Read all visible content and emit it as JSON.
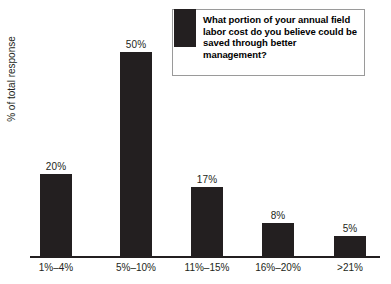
{
  "legend": {
    "question": "What portion of your annual field labor cost do you believe could be saved through better management?",
    "swatch_color": "#231f20",
    "swatch_name": "legend-color-swatch"
  },
  "axes": {
    "ylabel": "% of total response",
    "xlabel": ""
  },
  "chart_data": {
    "type": "bar",
    "title": "",
    "subtitle": "",
    "annotations": [
      "What portion of your annual field labor cost do you believe could be saved through better management?"
    ],
    "categories": [
      "1%–4%",
      "5%–10%",
      "11%–15%",
      "16%–20%",
      ">21%"
    ],
    "values": [
      20,
      50,
      17,
      8,
      5
    ],
    "value_labels": [
      "20%",
      "50%",
      "17%",
      "8%",
      "5%"
    ],
    "series": [
      {
        "name": "% of total response",
        "values": [
          20,
          50,
          17,
          8,
          5
        ],
        "color": "#231f20"
      }
    ],
    "xlabel": "",
    "ylabel": "% of total response",
    "ylim": [
      0,
      50
    ],
    "grid": false,
    "legend_position": "top-right",
    "bar_color": "#231f20"
  }
}
